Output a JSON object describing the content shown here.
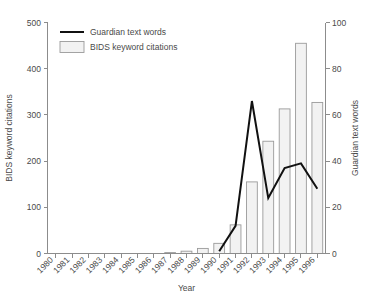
{
  "chart_data": {
    "type": "bar",
    "title": "",
    "subtitle": "",
    "xlabel": "Year",
    "ylabel": "BIDS keyword citations",
    "y2label": "Guardian text words",
    "categories": [
      "1980",
      "1981",
      "1982",
      "1983",
      "1984",
      "1985",
      "1986",
      "1987",
      "1988",
      "1989",
      "1990",
      "1991",
      "1992",
      "1993",
      "1994",
      "1995",
      "1996"
    ],
    "ylim": [
      0,
      500
    ],
    "y2lim": [
      0,
      100
    ],
    "yticks": [
      0,
      100,
      200,
      300,
      400,
      500
    ],
    "y2ticks": [
      0,
      20,
      40,
      60,
      80,
      100
    ],
    "grid": false,
    "legend_position": "top-left",
    "series": [
      {
        "name": "BIDS keyword citations",
        "type": "bar",
        "axis": "left",
        "values": [
          0,
          0,
          0,
          0,
          0,
          0,
          0,
          2,
          5,
          11,
          22,
          62,
          155,
          243,
          313,
          455,
          327
        ]
      },
      {
        "name": "Guardian text words",
        "type": "line",
        "axis": "right",
        "values": [
          null,
          null,
          null,
          null,
          null,
          null,
          null,
          null,
          null,
          null,
          1,
          12,
          66,
          24,
          37,
          39,
          28
        ]
      }
    ]
  },
  "legend": {
    "items": [
      {
        "label": "Guardian text words",
        "marker": "line"
      },
      {
        "label": "BIDS keyword citations",
        "marker": "box"
      }
    ]
  },
  "colors": {
    "bar_fill": "#f2f2f2",
    "bar_stroke": "#9a9a9a",
    "line": "#111111",
    "axis": "#8c8c8c",
    "text": "#4a4a4a",
    "background": "#ffffff"
  }
}
